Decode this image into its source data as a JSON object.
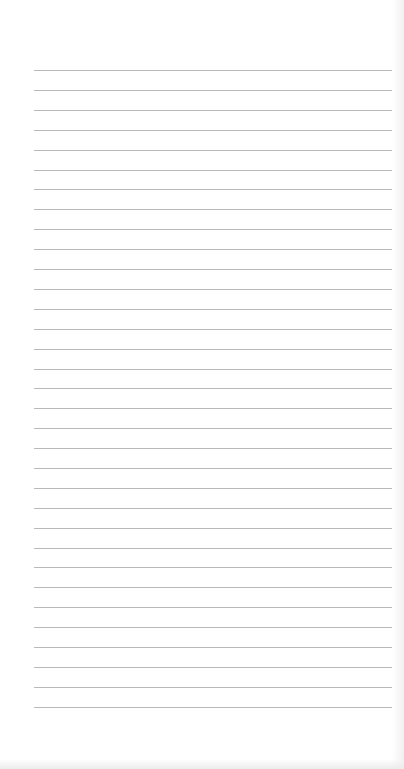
{
  "page": {
    "type": "lined-paper",
    "background_color": "#ffffff",
    "line_color": "#b9b9b9",
    "line_count": 33,
    "line_spacing_px": 19.9,
    "first_line_y": 70,
    "line_left_x": 34,
    "line_right_x": 392
  }
}
